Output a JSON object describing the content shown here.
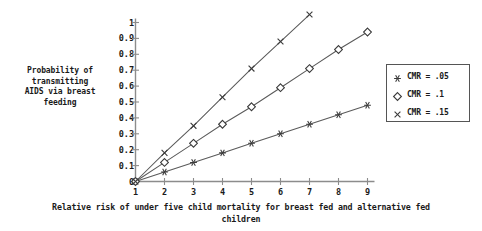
{
  "chart_data": {
    "type": "line",
    "title": "",
    "xlabel": "Relative risk of under five child mortality for breast fed and alternative fed children",
    "ylabel": "Probability of transmitting AIDS via breast feeding",
    "xlabel_lines": [
      "Relative risk of under five child mortality for breast fed and alternative fed",
      "children"
    ],
    "ylabel_lines": [
      "Probability of",
      "transmitting",
      "AIDS via breast",
      "feeding"
    ],
    "x": [
      1,
      2,
      3,
      4,
      5,
      6,
      7,
      8,
      9
    ],
    "xlim": [
      1,
      9
    ],
    "ylim": [
      0,
      1
    ],
    "xticks": [
      "1",
      "2",
      "3",
      "4",
      "5",
      "6",
      "7",
      "8",
      "9"
    ],
    "yticks": [
      "0",
      "0.1",
      "0.2",
      "0.3",
      "0.4",
      "0.5",
      "0.6",
      "0.7",
      "0.8",
      "0.9",
      "1"
    ],
    "ytick_values": [
      0,
      0.1,
      0.2,
      0.3,
      0.4,
      0.5,
      0.6,
      0.7,
      0.8,
      0.9,
      1
    ],
    "grid": false,
    "legend_position": "right",
    "series": [
      {
        "name": "CMR = .05",
        "marker": "asterisk",
        "color": "#3a3a3a",
        "x": [
          1,
          2,
          3,
          4,
          5,
          6,
          7,
          8,
          9
        ],
        "values": [
          0,
          0.06,
          0.12,
          0.18,
          0.24,
          0.3,
          0.36,
          0.42,
          0.48
        ]
      },
      {
        "name": "CMR = .1",
        "marker": "diamond",
        "color": "#3a3a3a",
        "x": [
          1,
          2,
          3,
          4,
          5,
          6,
          7,
          8,
          9
        ],
        "values": [
          0,
          0.12,
          0.24,
          0.36,
          0.47,
          0.59,
          0.71,
          0.83,
          0.94
        ]
      },
      {
        "name": "CMR = .15",
        "marker": "cross",
        "color": "#3a3a3a",
        "x": [
          1,
          2,
          3,
          4,
          5,
          6,
          7
        ],
        "values": [
          0,
          0.18,
          0.35,
          0.53,
          0.71,
          0.88,
          1.05
        ],
        "note": "series is clipped at the top of the plot area"
      }
    ]
  },
  "legend": {
    "items": [
      {
        "label": "CMR = .05",
        "marker": "asterisk"
      },
      {
        "label": "CMR = .1",
        "marker": "diamond"
      },
      {
        "label": "CMR = .15",
        "marker": "cross"
      }
    ]
  },
  "colors": {
    "axis": "#8c8c8c",
    "line": "#5a5a5a",
    "marker": "#3a3a3a",
    "text": "#1a1a1a",
    "legend_border": "#555555",
    "background": "#ffffff"
  }
}
